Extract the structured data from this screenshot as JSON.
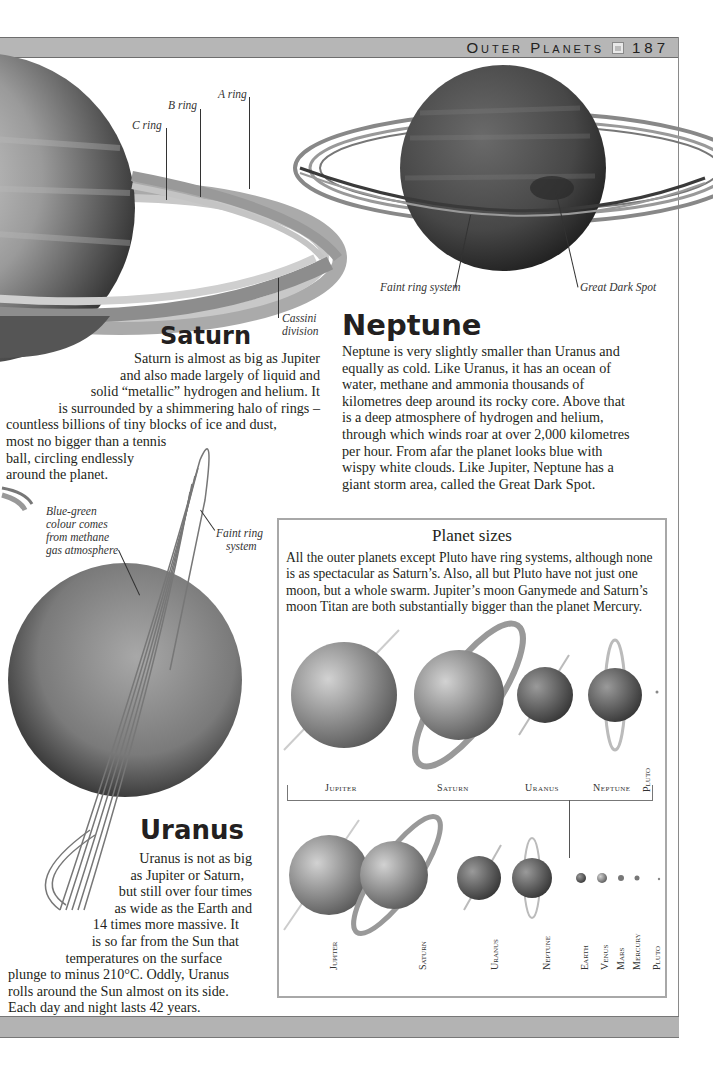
{
  "running_head": {
    "chapter": "Outer Planets",
    "page_number": "187",
    "icon": "page-icon"
  },
  "saturn": {
    "labels": {
      "a_ring": "A ring",
      "b_ring": "B ring",
      "c_ring": "C ring",
      "cassini_1": "Cassini",
      "cassini_2": "division"
    },
    "heading": "Saturn",
    "lines": [
      "Saturn is almost as big as Jupiter",
      "and also made largely of liquid and",
      "solid “metallic” hydrogen and helium. It",
      "is surrounded by a shimmering halo of rings –",
      "countless billions of tiny blocks of ice and dust,",
      "most no bigger than a tennis",
      "ball, circling endlessly",
      "around the planet."
    ]
  },
  "neptune": {
    "labels": {
      "faint_ring": "Faint ring system",
      "dark_spot": "Great Dark Spot"
    },
    "heading": "Neptune",
    "lines": [
      "Neptune is very slightly smaller than Uranus and",
      "equally as cold. Like Uranus, it has an ocean of",
      "water, methane and ammonia thousands of",
      "kilometres deep around its rocky core. Above that",
      "is a deep atmosphere of hydrogen and helium,",
      "through which winds roar at over 2,000 kilometres",
      "per hour. From afar the planet looks blue with",
      "wispy white clouds. Like Jupiter, Neptune has a",
      "giant storm area, called the Great Dark Spot."
    ]
  },
  "uranus": {
    "labels": {
      "colour_1": "Blue-green",
      "colour_2": "colour comes",
      "colour_3": "from methane",
      "colour_4": "gas atmosphere",
      "ring_1": "Faint ring",
      "ring_2": "system"
    },
    "heading": "Uranus",
    "lines": [
      "Uranus is not as big",
      "as Jupiter or Saturn,",
      "but still over four times",
      "as wide as the Earth and",
      "14 times more massive. It",
      "is so far from the Sun that",
      "temperatures on the surface",
      "plunge to minus 210°C. Oddly, Uranus",
      "rolls around the Sun almost on its side.",
      "Each day and night lasts 42 years."
    ]
  },
  "planet_sizes": {
    "title": "Planet sizes",
    "lines": [
      "All the outer planets except Pluto have ring systems, although none",
      "is as spectacular as Saturn’s. Also, all but Pluto have not just one",
      "moon, but a whole swarm. Jupiter’s moon Ganymede and Saturn’s",
      "moon Titan are both substantially bigger than the planet Mercury."
    ],
    "outer_row_labels": [
      "Jupiter",
      "Saturn",
      "Uranus",
      "Neptune",
      "Pluto"
    ],
    "all_row_labels": [
      "Jupiter",
      "Saturn",
      "Uranus",
      "Neptune",
      "Earth",
      "Venus",
      "Mars",
      "Mercury",
      "Pluto"
    ]
  }
}
